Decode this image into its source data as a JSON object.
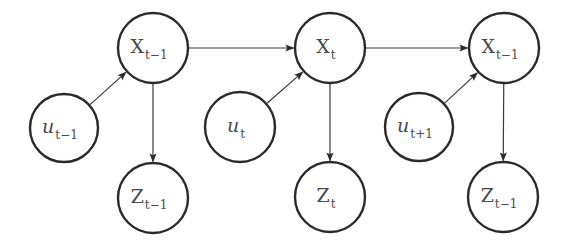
{
  "diagram": {
    "colors": {
      "stroke": "#2a2a2a",
      "edge": "#3a3a3a",
      "text": "#4a4a4a",
      "background": "#ffffff"
    },
    "nodes": [
      {
        "id": "x1",
        "base": "X",
        "sub": "t−1",
        "italic": false,
        "cx": 153,
        "cy": 48,
        "r": 35
      },
      {
        "id": "x2",
        "base": "X",
        "sub": "t",
        "italic": false,
        "cx": 330,
        "cy": 48,
        "r": 35
      },
      {
        "id": "x3",
        "base": "X",
        "sub": "t−1",
        "italic": false,
        "cx": 504,
        "cy": 48,
        "r": 35
      },
      {
        "id": "u1",
        "base": "u",
        "sub": "t−1",
        "italic": true,
        "cx": 64,
        "cy": 128,
        "r": 34
      },
      {
        "id": "u2",
        "base": "u",
        "sub": "t",
        "italic": true,
        "cx": 240,
        "cy": 127,
        "r": 35
      },
      {
        "id": "u3",
        "base": "u",
        "sub": "t+1",
        "italic": true,
        "cx": 419,
        "cy": 127,
        "r": 34
      },
      {
        "id": "z1",
        "base": "Z",
        "sub": "t−1",
        "italic": false,
        "cx": 153,
        "cy": 198,
        "r": 35
      },
      {
        "id": "z2",
        "base": "Z",
        "sub": "t",
        "italic": false,
        "cx": 330,
        "cy": 197,
        "r": 35
      },
      {
        "id": "z3",
        "base": "Z",
        "sub": "t−1",
        "italic": false,
        "cx": 503,
        "cy": 197,
        "r": 35
      }
    ],
    "edges": [
      {
        "from": "x1",
        "to": "x2"
      },
      {
        "from": "x2",
        "to": "x3"
      },
      {
        "from": "u1",
        "to": "x1"
      },
      {
        "from": "u2",
        "to": "x2"
      },
      {
        "from": "u3",
        "to": "x3"
      },
      {
        "from": "x1",
        "to": "z1"
      },
      {
        "from": "x2",
        "to": "z2"
      },
      {
        "from": "x3",
        "to": "z3"
      }
    ]
  }
}
